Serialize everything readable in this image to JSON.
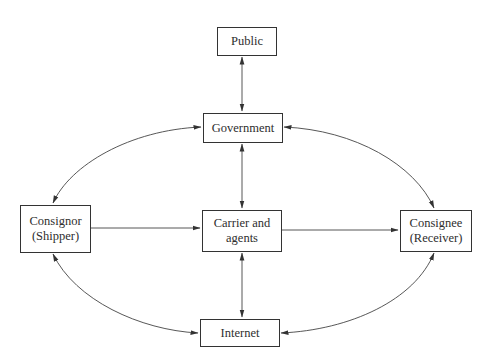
{
  "diagram": {
    "type": "flow-diagram",
    "nodes": {
      "public": {
        "lines": [
          "Public"
        ]
      },
      "government": {
        "lines": [
          "Government"
        ]
      },
      "consignor": {
        "lines": [
          "Consignor",
          "(Shipper)"
        ]
      },
      "carrier": {
        "lines": [
          "Carrier and",
          "agents"
        ]
      },
      "consignee": {
        "lines": [
          "Consignee",
          "(Receiver)"
        ]
      },
      "internet": {
        "lines": [
          "Internet"
        ]
      }
    },
    "edges": [
      {
        "from": "Public",
        "to": "Government",
        "direction": "both"
      },
      {
        "from": "Government",
        "to": "Carrier and agents",
        "direction": "both"
      },
      {
        "from": "Government",
        "to": "Consignor (Shipper)",
        "direction": "both",
        "shape": "curve"
      },
      {
        "from": "Government",
        "to": "Consignee (Receiver)",
        "direction": "both",
        "shape": "curve"
      },
      {
        "from": "Consignor (Shipper)",
        "to": "Carrier and agents",
        "direction": "forward"
      },
      {
        "from": "Carrier and agents",
        "to": "Consignee (Receiver)",
        "direction": "forward"
      },
      {
        "from": "Carrier and agents",
        "to": "Internet",
        "direction": "both"
      },
      {
        "from": "Consignor (Shipper)",
        "to": "Internet",
        "direction": "both",
        "shape": "curve"
      },
      {
        "from": "Consignee (Receiver)",
        "to": "Internet",
        "direction": "both",
        "shape": "curve"
      }
    ],
    "colors": {
      "line": "#333333",
      "box_border": "#333333",
      "background": "#ffffff"
    }
  }
}
